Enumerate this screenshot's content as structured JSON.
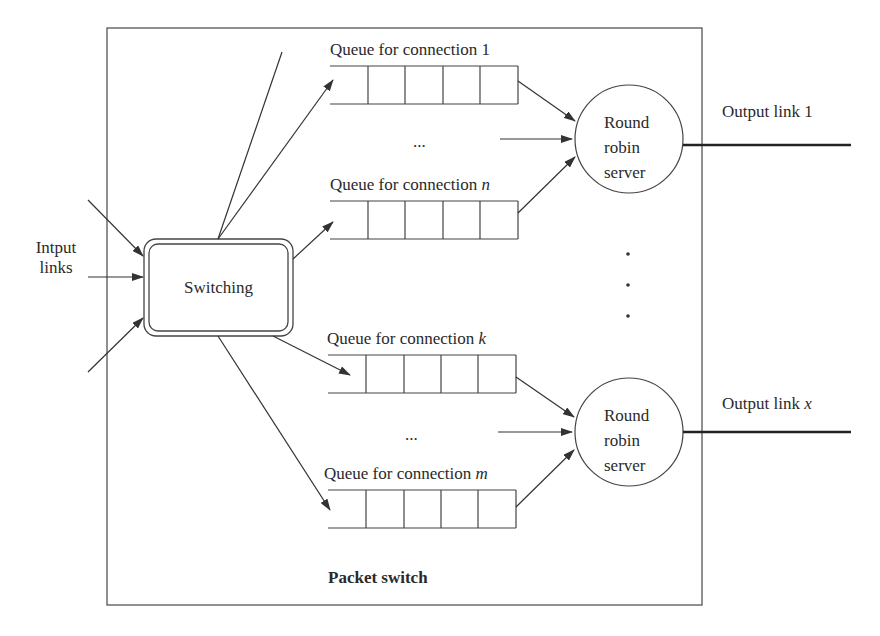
{
  "diagram": {
    "type": "packet-switch-round-robin",
    "container_label": "Packet switch",
    "input": {
      "label_line1": "Intput",
      "label_line2": "links",
      "arrow_count": 3
    },
    "switch": {
      "label": "Switching"
    },
    "queues": [
      {
        "prefix": "Queue for connection ",
        "id": "1",
        "italic": false,
        "cells": 5
      },
      {
        "prefix": "Queue for connection ",
        "id": "n",
        "italic": true,
        "cells": 5
      },
      {
        "prefix": "Queue for connection ",
        "id": "k",
        "italic": true,
        "cells": 5
      },
      {
        "prefix": "Queue for connection ",
        "id": "m",
        "italic": true,
        "cells": 5
      }
    ],
    "ellipsis_horizontal": "...",
    "ellipsis_vertical": "·",
    "servers": [
      {
        "line1": "Round",
        "line2": "robin",
        "line3": "server",
        "output_prefix": "Output link ",
        "output_id": "1",
        "output_italic": false
      },
      {
        "line1": "Round",
        "line2": "robin",
        "line3": "server",
        "output_prefix": "Output link ",
        "output_id": "x",
        "output_italic": true
      }
    ],
    "colors": {
      "stroke": "#3a3a3a",
      "background": "#ffffff",
      "text": "#2a2a2a"
    }
  }
}
